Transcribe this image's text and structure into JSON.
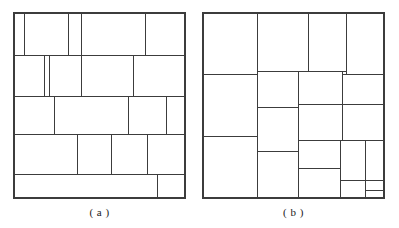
{
  "figure": {
    "background_color": "#ffffff",
    "line_color": "#3c3c3c",
    "fill_color": "#ffffff",
    "width": 399,
    "height": 228
  },
  "panels": [
    {
      "id": "panel-a",
      "caption": "( a )",
      "caption_letter": "a",
      "origin": {
        "x": 14,
        "y": 13
      },
      "size": {
        "width": 171,
        "height": 185
      },
      "rect_count": 23,
      "rectangles": [
        {
          "name": "a-r01",
          "x": 0,
          "y": 0,
          "w": 10,
          "h": 42
        },
        {
          "name": "a-r02",
          "x": 10,
          "y": 0,
          "w": 44,
          "h": 42
        },
        {
          "name": "a-r03",
          "x": 54,
          "y": 0,
          "w": 13,
          "h": 42
        },
        {
          "name": "a-r04",
          "x": 67,
          "y": 0,
          "w": 64,
          "h": 42
        },
        {
          "name": "a-r05",
          "x": 131,
          "y": 0,
          "w": 40,
          "h": 42
        },
        {
          "name": "a-r06",
          "x": 0,
          "y": 42,
          "w": 30,
          "h": 41
        },
        {
          "name": "a-r07",
          "x": 30,
          "y": 42,
          "w": 5,
          "h": 41
        },
        {
          "name": "a-r08",
          "x": 35,
          "y": 42,
          "w": 32,
          "h": 41
        },
        {
          "name": "a-r09",
          "x": 67,
          "y": 42,
          "w": 52,
          "h": 41
        },
        {
          "name": "a-r10",
          "x": 119,
          "y": 42,
          "w": 52,
          "h": 41
        },
        {
          "name": "a-r11",
          "x": 0,
          "y": 83,
          "w": 40,
          "h": 38
        },
        {
          "name": "a-r12",
          "x": 40,
          "y": 83,
          "w": 74,
          "h": 38
        },
        {
          "name": "a-r13",
          "x": 114,
          "y": 83,
          "w": 38,
          "h": 38
        },
        {
          "name": "a-r14",
          "x": 152,
          "y": 83,
          "w": 19,
          "h": 38
        },
        {
          "name": "a-r15",
          "x": 0,
          "y": 121,
          "w": 63,
          "h": 40
        },
        {
          "name": "a-r16",
          "x": 63,
          "y": 121,
          "w": 34,
          "h": 40
        },
        {
          "name": "a-r17",
          "x": 97,
          "y": 121,
          "w": 36,
          "h": 40
        },
        {
          "name": "a-r18",
          "x": 133,
          "y": 121,
          "w": 38,
          "h": 40
        },
        {
          "name": "a-r19",
          "x": 0,
          "y": 161,
          "w": 143,
          "h": 24
        },
        {
          "name": "a-r20",
          "x": 143,
          "y": 161,
          "w": 28,
          "h": 24
        }
      ]
    },
    {
      "id": "panel-b",
      "caption": "( b )",
      "caption_letter": "b",
      "origin": {
        "x": 203,
        "y": 13
      },
      "size": {
        "width": 181,
        "height": 185
      },
      "rect_count": 21,
      "rectangles": [
        {
          "name": "b-r01",
          "x": 0,
          "y": 0,
          "w": 54,
          "h": 61
        },
        {
          "name": "b-r02",
          "x": 54,
          "y": 0,
          "w": 51,
          "h": 58
        },
        {
          "name": "b-r03",
          "x": 105,
          "y": 0,
          "w": 38,
          "h": 58
        },
        {
          "name": "b-r04",
          "x": 143,
          "y": 0,
          "w": 38,
          "h": 61
        },
        {
          "name": "b-r05",
          "x": 0,
          "y": 61,
          "w": 54,
          "h": 62
        },
        {
          "name": "b-r06",
          "x": 54,
          "y": 58,
          "w": 41,
          "h": 36
        },
        {
          "name": "b-r07",
          "x": 95,
          "y": 58,
          "w": 44,
          "h": 33
        },
        {
          "name": "b-r08",
          "x": 139,
          "y": 61,
          "w": 42,
          "h": 30
        },
        {
          "name": "b-r09",
          "x": 54,
          "y": 94,
          "w": 41,
          "h": 44
        },
        {
          "name": "b-r10",
          "x": 95,
          "y": 91,
          "w": 44,
          "h": 36
        },
        {
          "name": "b-r11",
          "x": 139,
          "y": 91,
          "w": 42,
          "h": 36
        },
        {
          "name": "b-r12",
          "x": 0,
          "y": 123,
          "w": 54,
          "h": 62
        },
        {
          "name": "b-r13",
          "x": 54,
          "y": 138,
          "w": 41,
          "h": 47
        },
        {
          "name": "b-r14",
          "x": 95,
          "y": 127,
          "w": 42,
          "h": 28
        },
        {
          "name": "b-r15",
          "x": 137,
          "y": 127,
          "w": 25,
          "h": 40
        },
        {
          "name": "b-r16",
          "x": 162,
          "y": 127,
          "w": 19,
          "h": 40
        },
        {
          "name": "b-r17",
          "x": 95,
          "y": 155,
          "w": 42,
          "h": 30
        },
        {
          "name": "b-r18",
          "x": 137,
          "y": 167,
          "w": 25,
          "h": 18
        },
        {
          "name": "b-r19",
          "x": 162,
          "y": 167,
          "w": 19,
          "h": 10
        },
        {
          "name": "b-r20",
          "x": 162,
          "y": 177,
          "w": 19,
          "h": 8
        }
      ]
    }
  ]
}
